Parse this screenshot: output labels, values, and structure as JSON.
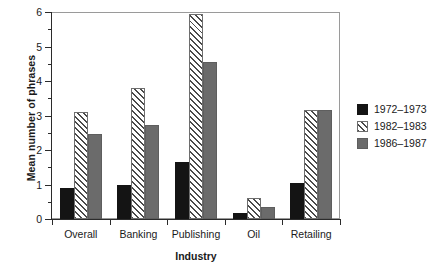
{
  "chart_data": {
    "type": "bar",
    "title": "",
    "xlabel": "Industry",
    "ylabel": "Mean number of phrases",
    "categories": [
      "Overall",
      "Banking",
      "Publishing",
      "Oil",
      "Retailing"
    ],
    "series": [
      {
        "name": "1972–1973",
        "color": "#141414",
        "pattern": "solid-black",
        "values": [
          0.9,
          1.0,
          1.65,
          0.18,
          1.05
        ]
      },
      {
        "name": "1982–1983",
        "color": "#ffffff",
        "pattern": "diagonal-hatch",
        "values": [
          3.1,
          3.8,
          5.95,
          0.62,
          3.15
        ]
      },
      {
        "name": "1986–1987",
        "color": "#6b6b6b",
        "pattern": "solid-gray",
        "values": [
          2.45,
          2.72,
          4.55,
          0.35,
          3.15
        ]
      }
    ],
    "ylim": [
      0,
      6
    ],
    "ytick_labels": [
      "0",
      "1",
      "2",
      "3",
      "4",
      "5",
      "6"
    ],
    "ytick_values": [
      0,
      1,
      2,
      3,
      4,
      5,
      6
    ],
    "yminor_values": [
      0.5,
      1.5,
      2.5,
      3.5,
      4.5,
      5.5
    ],
    "grid": false,
    "legend_position": "right"
  },
  "legend": {
    "entries": [
      {
        "label": "1972–1973"
      },
      {
        "label": "1982–1983"
      },
      {
        "label": "1986–1987"
      }
    ]
  }
}
